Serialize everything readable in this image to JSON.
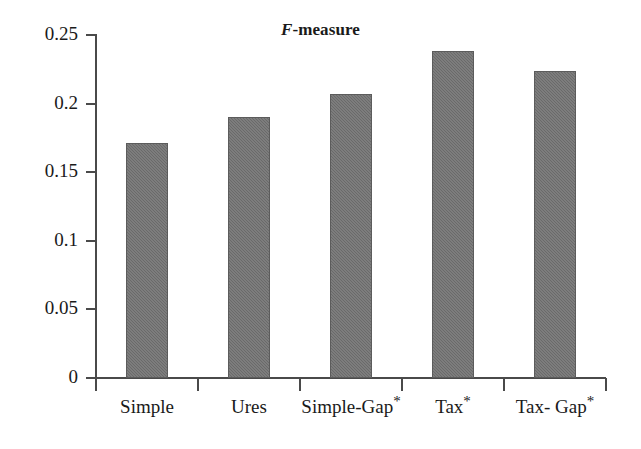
{
  "chart_data": {
    "type": "bar",
    "title": "F-measure",
    "title_parts": {
      "italic": "F",
      "rest": "-measure"
    },
    "xlabel": "",
    "ylabel": "",
    "categories": [
      "Simple",
      "Ures",
      "Simple-Gap*",
      "Tax*",
      "Tax- Gap*"
    ],
    "values": [
      0.171,
      0.19,
      0.207,
      0.238,
      0.224
    ],
    "ylim": [
      0,
      0.25
    ],
    "ytick_labels": [
      "0",
      "0.05",
      "0.1",
      "0.15",
      "0.2",
      "0.25"
    ],
    "ytick_values": [
      0,
      0.05,
      0.1,
      0.15,
      0.2,
      0.25
    ],
    "grid": false,
    "legend": false,
    "legend_position": "none",
    "bar_color": "#6a6a6a",
    "axis_color": "#4a4a4a",
    "background_color": "#ffffff"
  },
  "axis": {
    "y_ticks": [
      {
        "label": "0.25",
        "value": 0.25
      },
      {
        "label": "0.2",
        "value": 0.2
      },
      {
        "label": "0.15",
        "value": 0.15
      },
      {
        "label": "0.1",
        "value": 0.1
      },
      {
        "label": "0.05",
        "value": 0.05
      },
      {
        "label": "0",
        "value": 0
      }
    ]
  },
  "bars": [
    {
      "label": "Simple",
      "label_main": "Simple",
      "star": "",
      "value": 0.171
    },
    {
      "label": "Ures",
      "label_main": "Ures",
      "star": "",
      "value": 0.19
    },
    {
      "label": "Simple-Gap*",
      "label_main": "Simple-Gap",
      "star": "*",
      "value": 0.207
    },
    {
      "label": "Tax*",
      "label_main": "Tax",
      "star": "*",
      "value": 0.238
    },
    {
      "label": "Tax- Gap*",
      "label_main": "Tax- Gap",
      "star": "*",
      "value": 0.224
    }
  ]
}
